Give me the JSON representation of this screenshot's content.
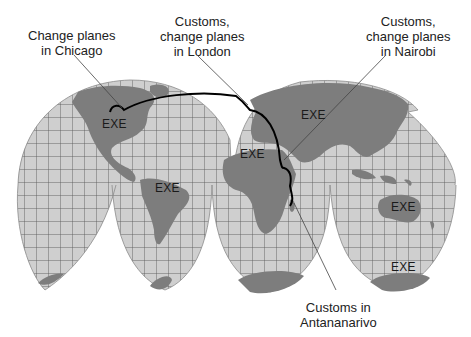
{
  "figure": {
    "type": "interrupted goode homolosine world map with flight route",
    "colors": {
      "ocean_graticule_fill": "#cfcfcf",
      "land": "#7d7d7d",
      "grid_lines": "#555555",
      "route": "#000000",
      "leader_lines": "#444444",
      "background": "#ffffff"
    }
  },
  "callouts": [
    {
      "id": "chicago",
      "lines": [
        "Change planes",
        "in Chicago"
      ]
    },
    {
      "id": "london",
      "lines": [
        "Customs,",
        "change planes",
        "in London"
      ]
    },
    {
      "id": "nairobi",
      "lines": [
        "Customs,",
        "change planes",
        "in Nairobi"
      ]
    },
    {
      "id": "antananarivo",
      "lines": [
        "Customs in",
        "Antananarivo"
      ]
    }
  ],
  "continent_labels": {
    "north_america": "EXE",
    "south_america": "EXE",
    "africa": "EXE",
    "asia": "EXE",
    "australia": "EXE",
    "antarctica": "EXE"
  },
  "route": {
    "stops": [
      "Chicago",
      "London",
      "Nairobi",
      "Antananarivo"
    ]
  }
}
